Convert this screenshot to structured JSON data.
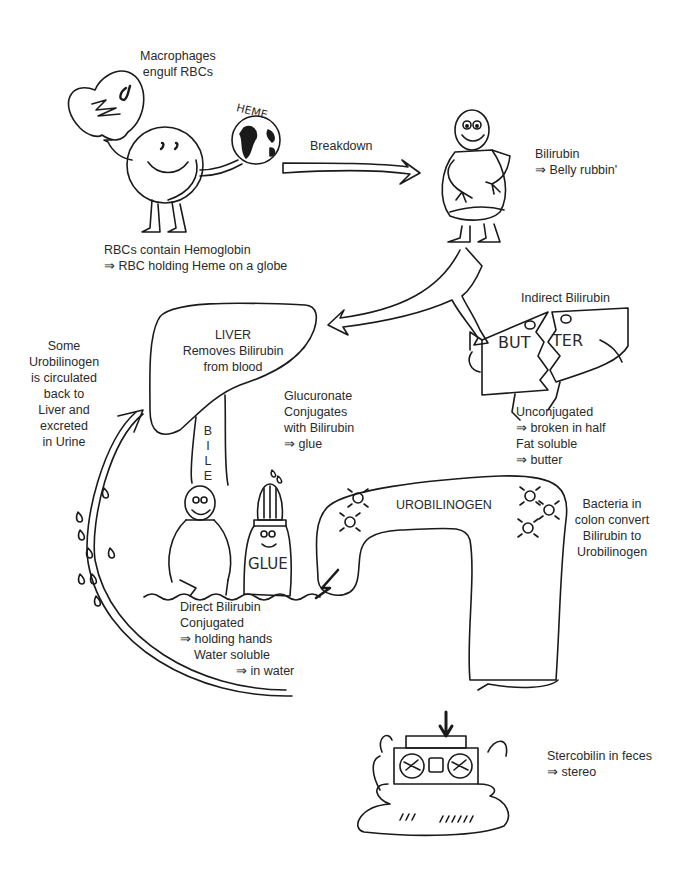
{
  "diagram": {
    "stroke_color": "#1a1a1a",
    "text_color": "#2a2a2a",
    "background": "#ffffff"
  },
  "labels": {
    "macrophages": {
      "lines": [
        "Macrophages",
        "engulf RBCs"
      ]
    },
    "heme_globe": "HEME",
    "rbc": {
      "lines": [
        "RBCs contain Hemoglobin",
        "⇒ RBC holding Heme on a globe"
      ]
    },
    "breakdown": "Breakdown",
    "bilirubin": {
      "lines": [
        "Bilirubin",
        "⇒ Belly rubbin'"
      ]
    },
    "liver": {
      "lines": [
        "LIVER",
        "Removes Bilirubin",
        "from blood"
      ]
    },
    "bile": [
      "B",
      "I",
      "L",
      "E"
    ],
    "indirect_bilirubin": "Indirect Bilirubin",
    "butter_left": "BUT",
    "butter_right": "TER",
    "unconjugated": {
      "lines": [
        "Unconjugated",
        "⇒ broken in half",
        "Fat soluble",
        "⇒ butter"
      ]
    },
    "urobilinogen_recirc": {
      "lines": [
        "Some",
        "Urobilinogen",
        "is circulated",
        "back to",
        "Liver and",
        "excreted",
        "in Urine"
      ]
    },
    "glucuronate": {
      "lines": [
        "Glucuronate",
        "Conjugates",
        "with Bilirubin",
        "⇒ glue"
      ]
    },
    "glue_bottle": "GLUE",
    "direct_bilirubin": {
      "lines": [
        "Direct Bilirubin",
        "Conjugated",
        "⇒ holding hands",
        "Water soluble",
        "⇒ in water"
      ]
    },
    "urobilinogen": "UROBILINOGEN",
    "bacteria": {
      "lines": [
        "Bacteria in",
        "colon convert",
        "Bilirubin to",
        "Urobilinogen"
      ]
    },
    "stercobilin": {
      "lines": [
        "Stercobilin in feces",
        "⇒ stereo"
      ]
    }
  }
}
